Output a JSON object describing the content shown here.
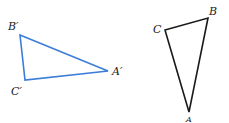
{
  "diagram": {
    "image_triangle": {
      "color": "#3b7dd8",
      "vertices": {
        "B_prime": {
          "label": "B′",
          "x": 20,
          "y": 35
        },
        "C_prime": {
          "label": "C′",
          "x": 25,
          "y": 80
        },
        "A_prime": {
          "label": "A′",
          "x": 108,
          "y": 71
        }
      }
    },
    "preimage_triangle": {
      "color": "#1a1a1a",
      "vertices": {
        "C": {
          "label": "C",
          "x": 165,
          "y": 30
        },
        "B": {
          "label": "B",
          "x": 208,
          "y": 18
        },
        "A": {
          "label": "A",
          "x": 189,
          "y": 112
        }
      }
    }
  }
}
